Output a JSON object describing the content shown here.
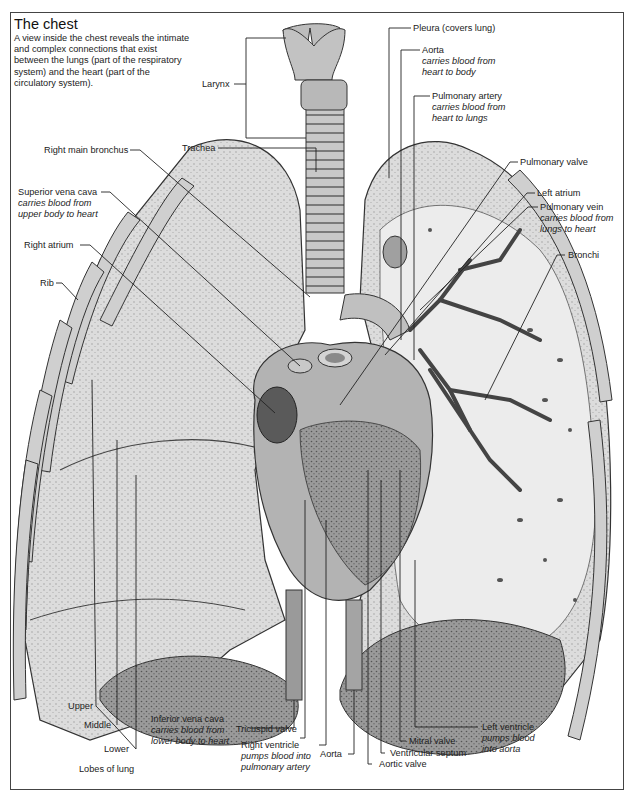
{
  "header": {
    "title": "The chest",
    "intro": "A view inside the chest reveals the intimate and complex connections that exist between the lungs (part of the respiratory system) and the heart (part of the circulatory system)."
  },
  "labels": {
    "larynx": {
      "name": "Larynx"
    },
    "trachea": {
      "name": "Trachea"
    },
    "pleura": {
      "name": "Pleura (covers lung)"
    },
    "aorta_top": {
      "name": "Aorta",
      "desc1": "carries blood from",
      "desc2": "heart to body"
    },
    "pulmonary_artery": {
      "name": "Pulmonary artery",
      "desc1": "carries blood from",
      "desc2": "heart to lungs"
    },
    "right_main_bronchus": {
      "name": "Right main bronchus"
    },
    "superior_vena_cava": {
      "name": "Superior vena cava",
      "desc1": "carries blood from",
      "desc2": "upper body to heart"
    },
    "right_atrium": {
      "name": "Right atrium"
    },
    "rib": {
      "name": "Rib"
    },
    "pulmonary_valve": {
      "name": "Pulmonary valve"
    },
    "left_atrium": {
      "name": "Left atrium"
    },
    "pulmonary_vein": {
      "name": "Pulmonary vein",
      "desc1": "carries blood from",
      "desc2": "lungs to heart"
    },
    "bronchi": {
      "name": "Bronchi"
    },
    "upper": {
      "name": "Upper"
    },
    "middle": {
      "name": "Middle"
    },
    "lower": {
      "name": "Lower"
    },
    "lobes_of_lung": {
      "name": "Lobes of lung"
    },
    "inferior_vena_cava": {
      "name": "Inferior vena cava",
      "desc1": "carries blood from",
      "desc2": "lower body to heart"
    },
    "tricuspid_valve": {
      "name": "Tricuspid valve"
    },
    "right_ventricle": {
      "name": "Right ventricle",
      "desc1": "pumps blood into",
      "desc2": "pulmonary artery"
    },
    "aorta_bottom": {
      "name": "Aorta"
    },
    "aortic_valve": {
      "name": "Aortic valve"
    },
    "ventricular_septum": {
      "name": "Ventricular septum"
    },
    "mitral_valve": {
      "name": "Mitral valve"
    },
    "left_ventricle": {
      "name": "Left ventricle",
      "desc1": "pumps blood",
      "desc2": "into aorta"
    }
  },
  "colors": {
    "line": "#222222",
    "lung_fill": "#d9d9d9",
    "lung_dark": "#8c8c8c",
    "heart_fill": "#a8a8a8",
    "frame": "#444444"
  }
}
